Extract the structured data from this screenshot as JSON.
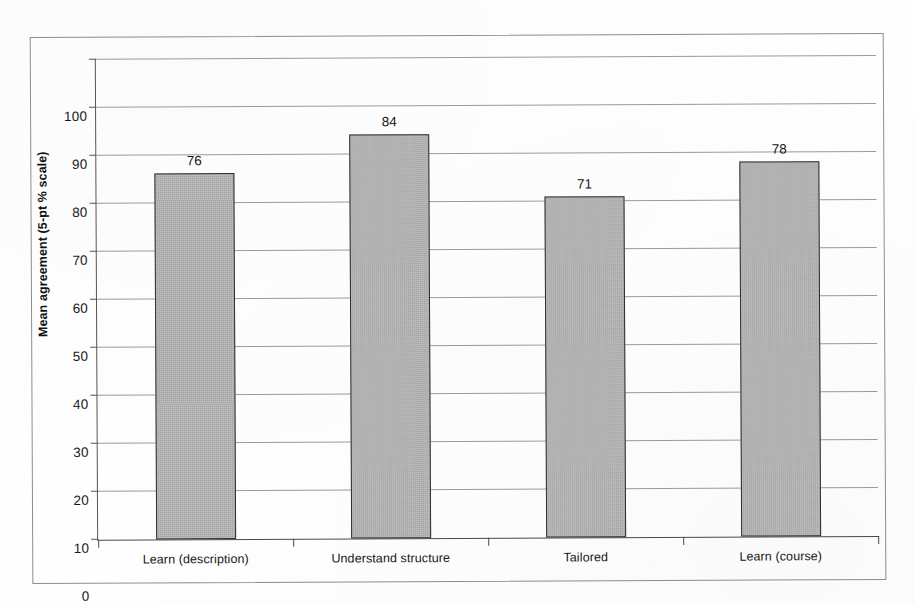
{
  "chart_data": {
    "type": "bar",
    "title": "",
    "subtitle": "",
    "xlabel": "",
    "ylabel": "Mean agreement (5-pt % scale)",
    "categories": [
      "Learn (description)",
      "Understand structure",
      "Tailored",
      "Learn (course)"
    ],
    "values": [
      76,
      84,
      71,
      78
    ],
    "value_labels": [
      "76",
      "84",
      "71",
      "78"
    ],
    "ylim": [
      0,
      100
    ],
    "ytick_labels": [
      "100",
      "90",
      "80",
      "70",
      "60",
      "50",
      "40",
      "30",
      "20",
      "10",
      "0"
    ],
    "ytick_values": [
      100,
      90,
      80,
      70,
      60,
      50,
      40,
      30,
      20,
      10,
      0
    ],
    "grid": true,
    "legend": false,
    "legend_position": "none",
    "bar_fill_color": "#b2b2b2",
    "bar_border_color": "#2e2e2e",
    "gridline_color": "#9a9a9a",
    "axis_color": "#4a4a4a",
    "frame_color": "#8d8d8d",
    "background_color": "#fefefe"
  }
}
